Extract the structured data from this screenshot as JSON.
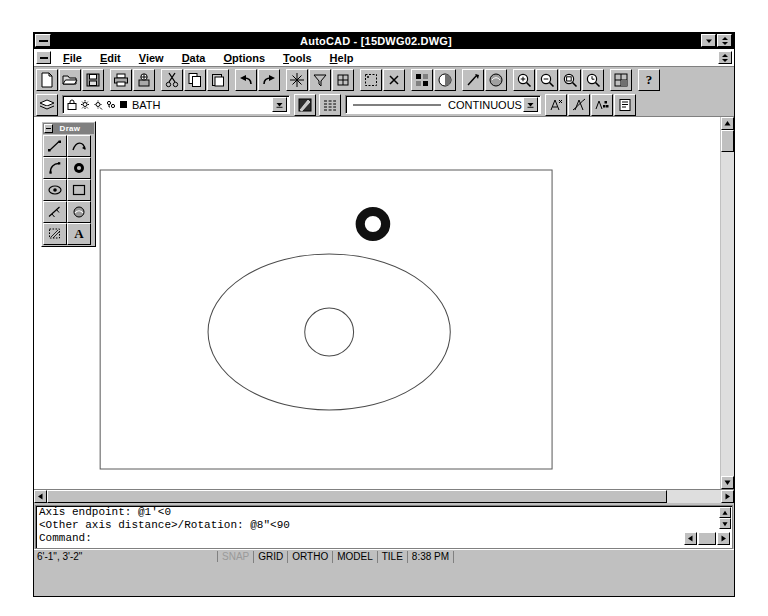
{
  "window": {
    "title": "AutoCAD - [15DWG02.DWG]",
    "sys_menu": "system-menu",
    "minimize_label": "▼",
    "maximize_label": "▲▼",
    "mdi_restore_label": "▲▼"
  },
  "menu": {
    "items": [
      {
        "label": "File",
        "accel": "F"
      },
      {
        "label": "Edit",
        "accel": "E"
      },
      {
        "label": "View",
        "accel": "V"
      },
      {
        "label": "Data",
        "accel": "D"
      },
      {
        "label": "Options",
        "accel": "O"
      },
      {
        "label": "Tools",
        "accel": "T"
      },
      {
        "label": "Help",
        "accel": "H"
      }
    ]
  },
  "toolbar": {
    "groups": [
      {
        "buttons": [
          {
            "name": "new-file-button",
            "tip": "New"
          },
          {
            "name": "open-file-button",
            "tip": "Open"
          },
          {
            "name": "save-file-button",
            "tip": "Save"
          }
        ]
      },
      {
        "buttons": [
          {
            "name": "print-button",
            "tip": "Print"
          },
          {
            "name": "print-preview-button",
            "tip": "Print Preview"
          }
        ]
      },
      {
        "buttons": [
          {
            "name": "cut-button",
            "tip": "Cut"
          },
          {
            "name": "copy-button",
            "tip": "Copy"
          },
          {
            "name": "paste-button",
            "tip": "Paste"
          }
        ]
      },
      {
        "buttons": [
          {
            "name": "undo-button",
            "tip": "Undo"
          },
          {
            "name": "redo-button",
            "tip": "Redo"
          }
        ]
      },
      {
        "buttons": [
          {
            "name": "object-snap-button",
            "tip": "Object Snap"
          },
          {
            "name": "filters-button",
            "tip": "Selection Filters"
          },
          {
            "name": "ucs-button",
            "tip": "UCS"
          }
        ]
      },
      {
        "buttons": [
          {
            "name": "named-ucs-button",
            "tip": "Named UCS"
          },
          {
            "name": "point-filters-button",
            "tip": "Point Filters"
          }
        ]
      },
      {
        "buttons": [
          {
            "name": "render-button",
            "tip": "Render"
          },
          {
            "name": "shade-button",
            "tip": "Shade"
          }
        ]
      },
      {
        "buttons": [
          {
            "name": "attribute-button",
            "tip": "Attribute"
          },
          {
            "name": "external-ref-button",
            "tip": "External Reference"
          }
        ]
      },
      {
        "buttons": [
          {
            "name": "zoom-in-button",
            "tip": "Zoom In"
          },
          {
            "name": "zoom-out-button",
            "tip": "Zoom Out"
          },
          {
            "name": "zoom-window-button",
            "tip": "Zoom Window"
          },
          {
            "name": "zoom-previous-button",
            "tip": "Zoom Previous"
          }
        ]
      },
      {
        "buttons": [
          {
            "name": "aerial-view-button",
            "tip": "Aerial View"
          }
        ]
      },
      {
        "buttons": [
          {
            "name": "help-button",
            "tip": "Help",
            "glyph": "?"
          }
        ]
      }
    ]
  },
  "properties_bar": {
    "layer_dialog_button": "layer-properties-button",
    "layer_name": "BATH",
    "layer_state_icons": [
      "lock-icon",
      "freeze-sun-icon",
      "freeze-viewport-icon",
      "thaw-icon",
      "color-swatch-icon"
    ],
    "color_button": "object-color-button",
    "linetype_button": "object-linetype-button",
    "linetype_name": "CONTINUOUS",
    "dropdown_arrow": "▼",
    "right_buttons": [
      {
        "name": "multiline-text-button",
        "tip": "Multiline Text"
      },
      {
        "name": "edit-text-button",
        "tip": "Edit Text"
      },
      {
        "name": "text-style-button",
        "tip": "Text Style"
      },
      {
        "name": "properties-button",
        "tip": "Properties"
      }
    ]
  },
  "draw_toolbar": {
    "title": "Draw",
    "close_label": "close-box",
    "buttons": [
      {
        "name": "line-tool",
        "label": "Line"
      },
      {
        "name": "polyline-tool",
        "label": "Polyline"
      },
      {
        "name": "arc-tool",
        "label": "Arc"
      },
      {
        "name": "circle-tool",
        "label": "Circle"
      },
      {
        "name": "ellipse-tool",
        "label": "Ellipse"
      },
      {
        "name": "rectangle-tool",
        "label": "Rectangle"
      },
      {
        "name": "spline-tool",
        "label": "Spline"
      },
      {
        "name": "polygon-tool",
        "label": "Polygon"
      },
      {
        "name": "hatch-tool",
        "label": "Hatch"
      },
      {
        "name": "text-tool",
        "label": "Text"
      }
    ]
  },
  "drawing": {
    "border_rect": {
      "x": 65,
      "y": 53,
      "w": 444,
      "h": 299
    },
    "ellipse": {
      "cx": 290,
      "cy": 215,
      "rx": 119,
      "ry": 78
    },
    "inner_circle": {
      "cx": 290,
      "cy": 215,
      "r": 24
    },
    "donut": {
      "cx": 333,
      "cy": 107,
      "r_outer": 17,
      "r_inner": 8,
      "fill": "#111111"
    }
  },
  "scrollbars": {
    "left_arrow": "◄",
    "right_arrow": "►",
    "up_arrow": "▲",
    "down_arrow": "▼"
  },
  "command_window": {
    "lines": [
      "Axis endpoint: @1'<0",
      "<Other axis distance>/Rotation: @8\"<90",
      "Command:"
    ],
    "nav_buttons": [
      "◄",
      "►"
    ]
  },
  "status_bar": {
    "coordinates": "6'-1\", 3'-2\"",
    "cells": [
      {
        "label": "SNAP",
        "active": false
      },
      {
        "label": "GRID",
        "active": true
      },
      {
        "label": "ORTHO",
        "active": true
      },
      {
        "label": "MODEL",
        "active": true
      },
      {
        "label": "TILE",
        "active": true
      },
      {
        "label": "8:38 PM",
        "active": true
      }
    ]
  },
  "colors": {
    "face": "#c0c0c0",
    "titlebar": "#000000",
    "canvas": "#ffffff",
    "ink": "#555555",
    "donut": "#111111"
  }
}
